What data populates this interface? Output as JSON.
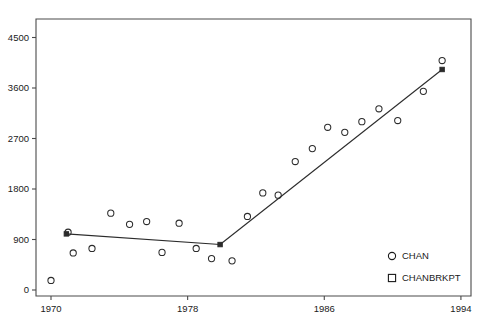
{
  "chart_data": {
    "type": "scatter",
    "title": "",
    "xlabel": "",
    "ylabel": "",
    "xlim": [
      1969.1,
      1994.6
    ],
    "ylim": [
      -60,
      4770
    ],
    "grid": false,
    "legend_position": "bottom-right",
    "x_ticks": [
      1970,
      1978,
      1986,
      1994
    ],
    "x_tick_labels": [
      "1970",
      "1978",
      "1986",
      "1994"
    ],
    "y_ticks": [
      0,
      900,
      1800,
      2700,
      3600,
      4500
    ],
    "y_tick_labels": [
      "0",
      "900",
      "1800",
      "2700",
      "3600",
      "4500"
    ],
    "series": [
      {
        "name": "CHAN",
        "marker": "circle",
        "points": [
          {
            "x": 1970.0,
            "y": 170
          },
          {
            "x": 1971.0,
            "y": 1030
          },
          {
            "x": 1971.3,
            "y": 660
          },
          {
            "x": 1972.4,
            "y": 740
          },
          {
            "x": 1973.5,
            "y": 1370
          },
          {
            "x": 1974.6,
            "y": 1170
          },
          {
            "x": 1975.6,
            "y": 1220
          },
          {
            "x": 1976.5,
            "y": 670
          },
          {
            "x": 1977.5,
            "y": 1190
          },
          {
            "x": 1978.5,
            "y": 740
          },
          {
            "x": 1979.4,
            "y": 560
          },
          {
            "x": 1980.6,
            "y": 520
          },
          {
            "x": 1981.5,
            "y": 1310
          },
          {
            "x": 1982.4,
            "y": 1730
          },
          {
            "x": 1983.3,
            "y": 1690
          },
          {
            "x": 1984.3,
            "y": 2290
          },
          {
            "x": 1985.3,
            "y": 2520
          },
          {
            "x": 1986.2,
            "y": 2900
          },
          {
            "x": 1987.2,
            "y": 2810
          },
          {
            "x": 1988.2,
            "y": 3000
          },
          {
            "x": 1989.2,
            "y": 3230
          },
          {
            "x": 1990.3,
            "y": 3020
          },
          {
            "x": 1991.8,
            "y": 3540
          },
          {
            "x": 1992.9,
            "y": 4090
          }
        ]
      },
      {
        "name": "CHANBRKPT",
        "marker": "square",
        "points": [
          {
            "x": 1970.9,
            "y": 1000
          },
          {
            "x": 1979.9,
            "y": 810
          },
          {
            "x": 1992.9,
            "y": 3930
          }
        ]
      }
    ],
    "fit_segments": [
      {
        "from": {
          "x": 1970.9,
          "y": 1000
        },
        "to": {
          "x": 1979.9,
          "y": 810
        }
      },
      {
        "from": {
          "x": 1979.9,
          "y": 810
        },
        "to": {
          "x": 1992.9,
          "y": 3930
        }
      }
    ],
    "legend": [
      {
        "label": "CHAN",
        "marker": "circle"
      },
      {
        "label": "CHANBRKPT",
        "marker": "square"
      }
    ]
  }
}
